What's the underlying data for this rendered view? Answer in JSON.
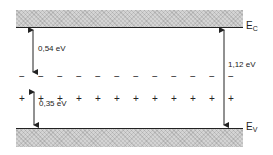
{
  "figure": {
    "type": "band-diagram",
    "conduction_band": {
      "label": "E",
      "subscript": "C"
    },
    "valence_band": {
      "label": "E",
      "subscript": "V"
    },
    "gaps": [
      {
        "label": "0,54 eV",
        "from": "E_C",
        "to": "acceptor level (−)"
      },
      {
        "label": "0,35 eV",
        "from": "E_V",
        "to": "donor level (+)"
      },
      {
        "label": "1,12 eV",
        "from": "E_C",
        "to": "E_V"
      }
    ],
    "acceptor_level": {
      "symbol": "−",
      "count": 12
    },
    "donor_level": {
      "symbol": "+",
      "count": 12
    }
  }
}
